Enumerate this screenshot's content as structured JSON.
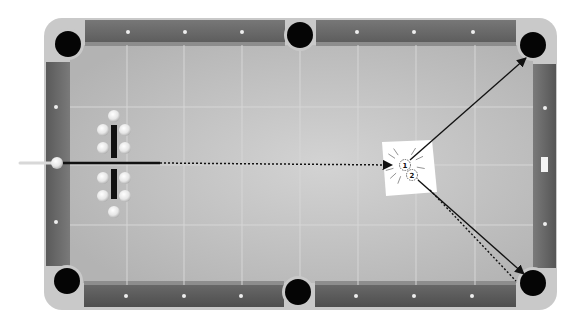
{
  "diagram": {
    "title": "",
    "type": "pool-table-shot-diagram",
    "colors": {
      "background": "#ffffff",
      "frame": "#c9c9c9",
      "rail_dark": "#5e5e5e",
      "rail_light": "#8a8a8a",
      "felt": "#b9b9b9",
      "felt_highlight": "#d2d2d2",
      "pocket": "#050505",
      "ball": "#eeeeee",
      "line": "#111111",
      "paper": "#ffffff"
    },
    "table": {
      "frame": {
        "x": 44,
        "y": 18,
        "w": 513,
        "h": 292,
        "r": 18
      },
      "felt": {
        "x": 70,
        "y": 45,
        "w": 463,
        "h": 240
      },
      "grid_x": [
        127,
        184,
        242,
        300,
        358,
        416,
        475
      ],
      "grid_y": [
        107,
        165,
        225
      ],
      "pockets": [
        {
          "name": "top-left",
          "cx": 68,
          "cy": 44
        },
        {
          "name": "top-middle",
          "cx": 300,
          "cy": 35
        },
        {
          "name": "top-right",
          "cx": 533,
          "cy": 45
        },
        {
          "name": "bottom-left",
          "cx": 67,
          "cy": 281
        },
        {
          "name": "bottom-middle",
          "cx": 298,
          "cy": 292
        },
        {
          "name": "bottom-right",
          "cx": 533,
          "cy": 283
        }
      ],
      "diamonds_top": [
        128,
        185,
        242,
        357,
        414,
        473
      ],
      "diamonds_bottom": [
        126,
        184,
        241,
        356,
        414,
        472
      ],
      "diamonds_left": [
        107,
        222
      ],
      "diamonds_right": [
        108,
        224
      ]
    },
    "cue": {
      "x1": 20,
      "y1": 163,
      "x2": 52,
      "y2": 163
    },
    "cue_ball": {
      "cx": 57,
      "cy": 163,
      "r": 6
    },
    "rack_balls": [
      {
        "cx": 114,
        "cy": 116
      },
      {
        "cx": 103,
        "cy": 130
      },
      {
        "cx": 125,
        "cy": 130
      },
      {
        "cx": 103,
        "cy": 148
      },
      {
        "cx": 125,
        "cy": 148
      },
      {
        "cx": 103,
        "cy": 178
      },
      {
        "cx": 125,
        "cy": 178
      },
      {
        "cx": 103,
        "cy": 196
      },
      {
        "cx": 125,
        "cy": 196
      },
      {
        "cx": 114,
        "cy": 212
      }
    ],
    "rack_bars": [
      {
        "x": 111,
        "y": 125,
        "w": 6,
        "h": 33
      },
      {
        "x": 111,
        "y": 169,
        "w": 6,
        "h": 30
      }
    ],
    "target_paper": {
      "points": "382,142 432,140 437,192 386,196"
    },
    "object_balls": [
      {
        "label": "1",
        "cx": 405,
        "cy": 165
      },
      {
        "label": "2",
        "cx": 412,
        "cy": 175
      }
    ],
    "shot_lines": {
      "cue_path_solid": {
        "x1": 60,
        "y1": 163,
        "x2": 160,
        "y2": 163
      },
      "cue_path_dotted": {
        "x1": 160,
        "y1": 163,
        "x2": 392,
        "y2": 165
      },
      "ball1_to_top_right": {
        "x1": 410,
        "y1": 160,
        "x2": 526,
        "y2": 58
      },
      "ball2_to_bottom_right": {
        "x1": 418,
        "y1": 180,
        "x2": 524,
        "y2": 274
      },
      "ball2_dotted": {
        "x1": 430,
        "y1": 190,
        "x2": 516,
        "y2": 281
      }
    },
    "right_rail_marker": {
      "x": 541,
      "y": 157,
      "w": 7,
      "h": 15
    }
  }
}
